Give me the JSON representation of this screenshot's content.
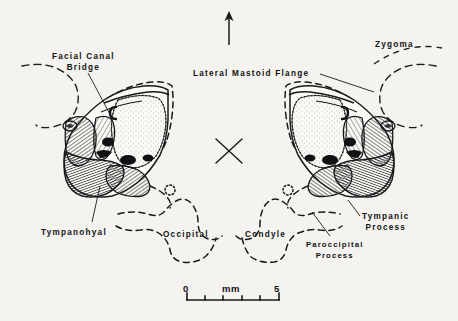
{
  "figure": {
    "kind": "anatomical-line-drawing",
    "background_color": "#f4f3f0",
    "ink_color": "#1a1a1a"
  },
  "orientation": {
    "arrow_icon": "up-arrow",
    "midline_marker_icon": "x-cross"
  },
  "labels": {
    "facial_canal_bridge": {
      "line1": "Facial  Canal",
      "line2": "Bridge"
    },
    "lateral_mastoid_flange": {
      "line1": "Lateral  Mastoid  Flange"
    },
    "zygoma": {
      "line1": "Zygoma"
    },
    "tympanohyal": {
      "line1": "Tympanohyal"
    },
    "occipital": {
      "line1": "Occipital"
    },
    "condyle": {
      "line1": "Condyle"
    },
    "paroccipital_process": {
      "line1": "Paroccipital",
      "line2": "Process"
    },
    "tympanic_process": {
      "line1": "Tympanic",
      "line2": "Process"
    }
  },
  "scale_bar": {
    "start_label": "0",
    "unit_label": "mm",
    "end_label": "5",
    "ticks": 6
  }
}
